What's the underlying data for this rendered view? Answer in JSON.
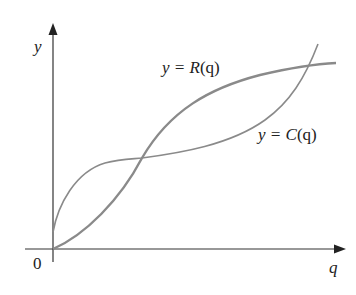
{
  "figure": {
    "axes": {
      "x_label": "q",
      "y_label": "y",
      "origin_label": "0"
    },
    "curves": [
      {
        "name": "revenue",
        "label_prefix": "y = ",
        "label_func": "R",
        "label_arg": "(q)"
      },
      {
        "name": "cost",
        "label_prefix": "y = ",
        "label_func": "C",
        "label_arg": "(q)"
      }
    ],
    "colors": {
      "axis": "#333333",
      "curve": "#8a8a8a",
      "text": "#222222"
    }
  }
}
